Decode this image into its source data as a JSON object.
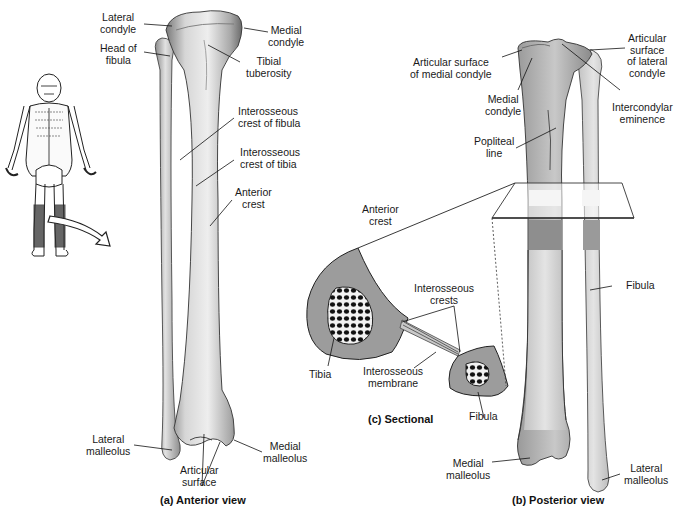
{
  "figure": {
    "panels": {
      "anterior": {
        "caption": "(a) Anterior view",
        "labels": {
          "lateral_condyle": "Lateral\ncondyle",
          "head_of_fibula": "Head of\nfibula",
          "medial_condyle": "Medial\ncondyle",
          "tibial_tuberosity": "Tibial\ntuberosity",
          "interosseous_crest_fibula": "Interosseous\ncrest of fibula",
          "interosseous_crest_tibia": "Interosseous\ncrest of tibia",
          "anterior_crest": "Anterior\ncrest",
          "lateral_malleolus": "Lateral\nmalleolus",
          "medial_malleolus": "Medial\nmalleolus",
          "articular_surface": "Articular\nsurface"
        }
      },
      "posterior": {
        "caption": "(b) Posterior view",
        "labels": {
          "articular_surface_medial": "Articular surface\nof medial condyle",
          "articular_surface_lateral": "Articular\nsurface\nof lateral\ncondyle",
          "medial_condyle": "Medial\ncondyle",
          "intercondylar_eminence": "Intercondylar\neminence",
          "popliteal_line": "Popliteal\nline",
          "fibula": "Fibula",
          "medial_malleolus": "Medial\nmalleolus",
          "lateral_malleolus": "Lateral\nmalleolus"
        }
      },
      "sectional": {
        "caption": "(c) Sectional",
        "labels": {
          "anterior_crest": "Anterior\ncrest",
          "interosseous_crests": "Interosseous\ncrests",
          "tibia": "Tibia",
          "interosseous_membrane": "Interosseous\nmembrane",
          "fibula": "Fibula"
        }
      }
    },
    "colors": {
      "bone_light": "#e6e6e6",
      "bone_mid": "#b8b8b8",
      "bone_dark": "#6e6e6e",
      "section_fill": "#9a9a9a",
      "outline": "#1a1a1a"
    }
  }
}
